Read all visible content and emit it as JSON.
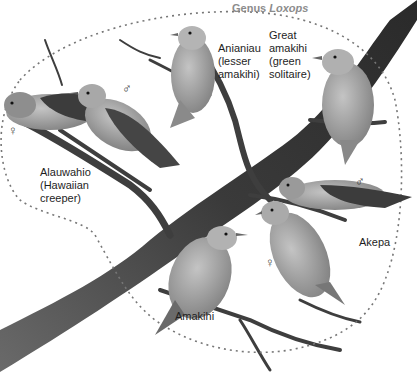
{
  "figure": {
    "group_label": {
      "prefix": "Genus",
      "genus_name": "Loxops"
    },
    "species": [
      {
        "name": "Alauwahio",
        "common": "(Hawaiian creeper)",
        "text": "Alauwahio\n(Hawaiian\ncreeper)"
      },
      {
        "name": "Anianiau",
        "common": "(lesser amakihi)",
        "text": "Anianiau\n(lesser\namakihi)"
      },
      {
        "name": "Great amakihi",
        "common": "(green solitaire)",
        "text": "Great\namakihi\n(green\nsolitaire)"
      },
      {
        "name": "Akepa",
        "text": "Akepa"
      },
      {
        "name": "Amakihi",
        "text": "Amakihi"
      }
    ],
    "sex_symbols": {
      "male": "♂",
      "female": "♀"
    },
    "colors": {
      "background": "#ffffff",
      "branch": "#3c3c3c",
      "bird_body": "#9a9a9a",
      "bird_wing": "#4a4a4a",
      "boundary_dots": "#777777",
      "genus_label": "#8c8c8c",
      "text": "#1e1e1e"
    }
  }
}
